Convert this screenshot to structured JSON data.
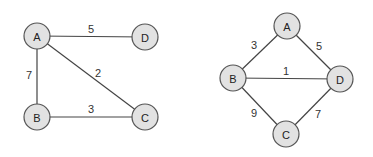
{
  "graphs": [
    {
      "name": "graph-left",
      "nodes": [
        {
          "id": "A",
          "label": "A",
          "x": 37,
          "y": 36
        },
        {
          "id": "D",
          "label": "D",
          "x": 145,
          "y": 37
        },
        {
          "id": "B",
          "label": "B",
          "x": 37,
          "y": 117
        },
        {
          "id": "C",
          "label": "C",
          "x": 145,
          "y": 117
        }
      ],
      "edges": [
        {
          "from": "A",
          "to": "D",
          "weight": "5",
          "lx": 91,
          "ly": 29
        },
        {
          "from": "A",
          "to": "B",
          "weight": "7",
          "lx": 29,
          "ly": 75
        },
        {
          "from": "A",
          "to": "C",
          "weight": "2",
          "lx": 98,
          "ly": 73
        },
        {
          "from": "B",
          "to": "C",
          "weight": "3",
          "lx": 91,
          "ly": 109
        }
      ]
    },
    {
      "name": "graph-right",
      "nodes": [
        {
          "id": "A",
          "label": "A",
          "x": 287,
          "y": 26
        },
        {
          "id": "B",
          "label": "B",
          "x": 233,
          "y": 78
        },
        {
          "id": "D",
          "label": "D",
          "x": 340,
          "y": 79
        },
        {
          "id": "C",
          "label": "C",
          "x": 286,
          "y": 134
        }
      ],
      "edges": [
        {
          "from": "B",
          "to": "A",
          "weight": "3",
          "lx": 254,
          "ly": 45
        },
        {
          "from": "A",
          "to": "D",
          "weight": "5",
          "lx": 319,
          "ly": 46
        },
        {
          "from": "B",
          "to": "D",
          "weight": "1",
          "lx": 286,
          "ly": 71
        },
        {
          "from": "B",
          "to": "C",
          "weight": "9",
          "lx": 254,
          "ly": 113
        },
        {
          "from": "D",
          "to": "C",
          "weight": "7",
          "lx": 318,
          "ly": 114
        }
      ]
    }
  ],
  "style": {
    "node_radius": 13,
    "node_fill": "#e2e2e2",
    "node_stroke": "#555555",
    "edge_color": "#444444"
  }
}
